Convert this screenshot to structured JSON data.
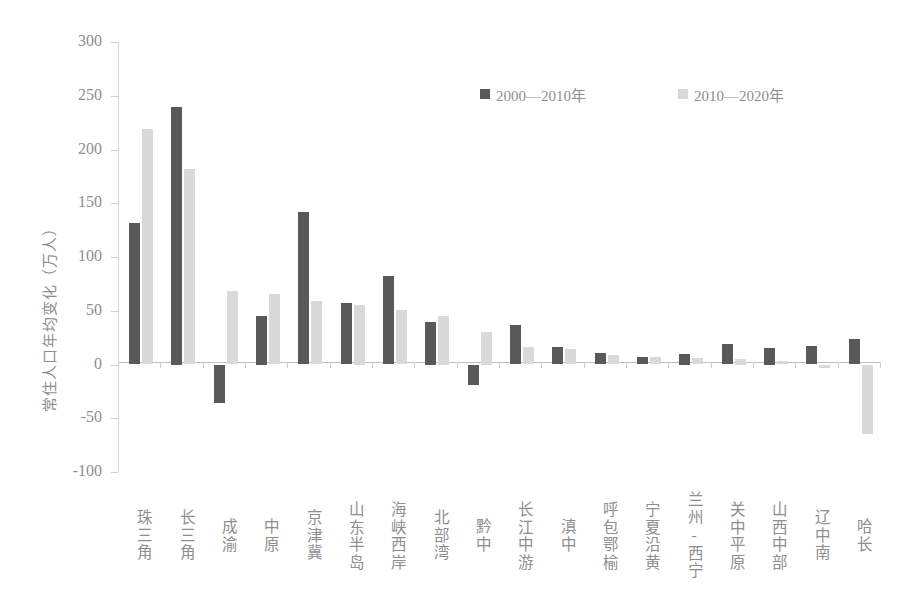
{
  "chart_data": {
    "type": "bar",
    "title": "",
    "xlabel": "",
    "ylabel": "常住人口年均变化（万人）",
    "ylim": [
      -100,
      300
    ],
    "ytick_labels": [
      "300",
      "250",
      "200",
      "150",
      "100",
      "50",
      "0",
      "-50",
      "-100"
    ],
    "ytick_values": [
      300,
      250,
      200,
      150,
      100,
      50,
      0,
      -50,
      -100
    ],
    "grid": false,
    "legend_position": "top-center",
    "categories": [
      "珠三角",
      "长三角",
      "成渝",
      "中原",
      "京津冀",
      "山东半岛",
      "海峡西岸",
      "北部湾",
      "黔中",
      "长江中游",
      "滇中",
      "呼包鄂榆",
      "宁夏沿黄",
      "兰州-西宁",
      "关中平原",
      "山西中部",
      "辽中南",
      "哈长"
    ],
    "series": [
      {
        "name": "2000—2010年",
        "color": "#595959",
        "values": [
          132,
          240,
          -36,
          45,
          142,
          57,
          82,
          40,
          -19,
          37,
          16,
          11,
          7,
          10,
          19,
          15,
          17,
          24
        ]
      },
      {
        "name": "2010—2020年",
        "color": "#d9d9d9",
        "values": [
          219,
          182,
          68,
          66,
          59,
          55,
          51,
          45,
          30,
          16,
          14,
          9,
          7,
          6,
          5,
          3,
          -3,
          -65
        ]
      }
    ]
  },
  "legend": {
    "items": [
      {
        "label": "2000—2010年",
        "color": "#595959"
      },
      {
        "label": "2010—2020年",
        "color": "#d9d9d9"
      }
    ]
  },
  "axis": {
    "y_title": "常住人口年均变化（万人）"
  }
}
